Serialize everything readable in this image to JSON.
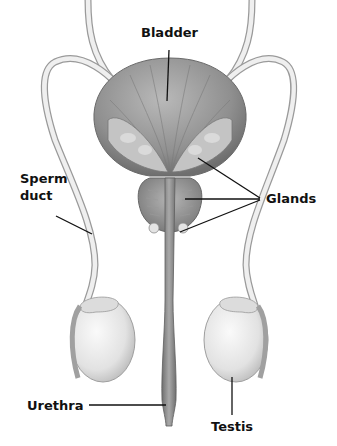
{
  "labels": {
    "bladder": "Bladder",
    "sperm_duct_line1": "Sperm",
    "sperm_duct_line2": "duct",
    "glands": "Glands",
    "urethra": "Urethra",
    "testis": "Testis"
  },
  "colors": {
    "background": "#ffffff",
    "label_text": "#111111",
    "leader_line": "#111111",
    "organ_dark": "#7d7d7d",
    "organ_mid": "#a6a6a6",
    "organ_light": "#e6e6e6",
    "duct_fill": "#efefef",
    "duct_stroke": "#9a9a9a"
  }
}
